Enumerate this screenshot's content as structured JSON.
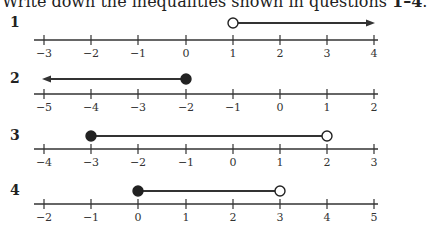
{
  "heading": {
    "text_before": "Write down the inequalities shown in questions ",
    "bold_range": "1–4",
    "text_after": "."
  },
  "chart_data": [
    {
      "type": "number_line",
      "question": "1",
      "ticks": [
        -3,
        -2,
        -1,
        0,
        1,
        2,
        3,
        4
      ],
      "tick_labels": [
        "−3",
        "−2",
        "−1",
        "0",
        "1",
        "2",
        "3",
        "4"
      ],
      "start": {
        "value": 1,
        "closed": false
      },
      "end": {
        "value": 4,
        "arrow": true,
        "direction": "right"
      },
      "inequality": "x > 1"
    },
    {
      "type": "number_line",
      "question": "2",
      "ticks": [
        -5,
        -4,
        -3,
        -2,
        -1,
        0,
        1,
        2
      ],
      "tick_labels": [
        "−5",
        "−4",
        "−3",
        "−2",
        "−1",
        "0",
        "1",
        "2"
      ],
      "start": {
        "value": -2,
        "closed": true
      },
      "end": {
        "value": -5,
        "arrow": true,
        "direction": "left"
      },
      "inequality": "x ≤ −2"
    },
    {
      "type": "number_line",
      "question": "3",
      "ticks": [
        -4,
        -3,
        -2,
        -1,
        0,
        1,
        2,
        3
      ],
      "tick_labels": [
        "−4",
        "−3",
        "−2",
        "−1",
        "0",
        "1",
        "2",
        "3"
      ],
      "start": {
        "value": -3,
        "closed": true
      },
      "end": {
        "value": 2,
        "closed": false
      },
      "inequality": "−3 ≤ x < 2"
    },
    {
      "type": "number_line",
      "question": "4",
      "ticks": [
        -2,
        -1,
        0,
        1,
        2,
        3,
        4,
        5
      ],
      "tick_labels": [
        "−2",
        "−1",
        "0",
        "1",
        "2",
        "3",
        "4",
        "5"
      ],
      "start": {
        "value": 0,
        "closed": true
      },
      "end": {
        "value": 3,
        "closed": false
      },
      "inequality": "0 ≤ x < 3"
    }
  ],
  "colors": {
    "line": "#333333",
    "dot": "#222222",
    "open_fill": "#ffffff"
  }
}
